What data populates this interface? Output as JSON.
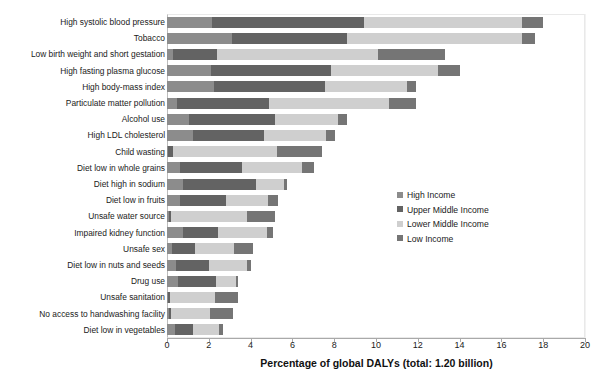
{
  "chart_data": {
    "type": "bar",
    "orientation": "horizontal",
    "stacked": true,
    "title": "",
    "xlabel": "Percentage of global DALYs (total: 1.20 billion)",
    "ylabel": "",
    "xlim": [
      0,
      20
    ],
    "xticks": [
      0,
      2,
      4,
      6,
      8,
      10,
      12,
      14,
      16,
      18,
      20
    ],
    "grid": false,
    "legend_position": "middle-right",
    "categories": [
      "High systolic blood pressure",
      "Tobacco",
      "Low birth weight and short gestation",
      "High fasting plasma glucose",
      "High body-mass index",
      "Particulate matter pollution",
      "Alcohol use",
      "High LDL cholesterol",
      "Child wasting",
      "Diet low in whole grains",
      "Diet high in sodium",
      "Diet low in fruits",
      "Unsafe water source",
      "Impaired kidney function",
      "Unsafe sex",
      "Diet low in nuts and seeds",
      "Drug use",
      "Unsafe sanitation",
      "No access to handwashing facility",
      "Diet low in vegetables"
    ],
    "series": [
      {
        "name": "High Income",
        "color": "#8c8c8c",
        "values": [
          2.15,
          3.1,
          0.3,
          2.1,
          2.25,
          0.5,
          1.05,
          1.25,
          0.05,
          0.6,
          0.75,
          0.6,
          0.1,
          0.75,
          0.25,
          0.45,
          0.55,
          0.05,
          0.1,
          0.4
        ]
      },
      {
        "name": "Upper Middle Income",
        "color": "#636363",
        "values": [
          7.3,
          5.5,
          2.1,
          5.75,
          5.3,
          4.4,
          4.1,
          3.4,
          0.25,
          3.0,
          3.5,
          2.2,
          0.1,
          1.7,
          1.1,
          1.55,
          1.8,
          0.1,
          0.1,
          0.85
        ]
      },
      {
        "name": "Lower Middle Income",
        "color": "#cfcfcf",
        "values": [
          7.55,
          8.4,
          7.7,
          5.1,
          3.95,
          5.7,
          3.05,
          2.95,
          4.95,
          2.85,
          1.35,
          2.05,
          3.65,
          2.35,
          1.85,
          1.85,
          0.95,
          2.15,
          1.85,
          1.25
        ]
      },
      {
        "name": "Low Income",
        "color": "#757575",
        "values": [
          1.0,
          0.6,
          3.2,
          1.05,
          0.4,
          1.3,
          0.4,
          0.45,
          2.15,
          0.6,
          0.15,
          0.45,
          1.3,
          0.25,
          0.9,
          0.15,
          0.1,
          1.1,
          1.1,
          0.2
        ]
      }
    ],
    "totals": [
      18.0,
      17.6,
      13.3,
      14.0,
      11.9,
      11.9,
      8.6,
      8.05,
      7.4,
      7.05,
      5.75,
      5.3,
      5.15,
      5.05,
      4.1,
      4.0,
      3.4,
      3.4,
      3.15,
      2.7
    ],
    "legend": [
      "High Income",
      "Upper Middle Income",
      "Lower Middle Income",
      "Low Income"
    ]
  }
}
